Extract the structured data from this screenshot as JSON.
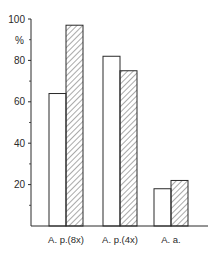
{
  "chart_data": {
    "type": "bar",
    "title": "",
    "xlabel": "",
    "ylabel": "%",
    "ylim": [
      0,
      100
    ],
    "yticks": [
      20,
      40,
      60,
      80,
      100
    ],
    "ytick_labels": [
      "20",
      "40",
      "60",
      "80",
      "100"
    ],
    "minor_yticks": [
      10,
      30,
      50,
      70,
      90
    ],
    "grid": false,
    "legend": null,
    "categories": [
      "A. p.(8x)",
      "A. p.(4x)",
      "A. a."
    ],
    "series": [
      {
        "name": "open",
        "style": "white",
        "values": [
          64,
          82,
          18
        ]
      },
      {
        "name": "hatched",
        "style": "hatched",
        "values": [
          97,
          75,
          22
        ]
      }
    ]
  },
  "colors": {
    "ink": "#2a2a2a",
    "background": "#ffffff"
  }
}
